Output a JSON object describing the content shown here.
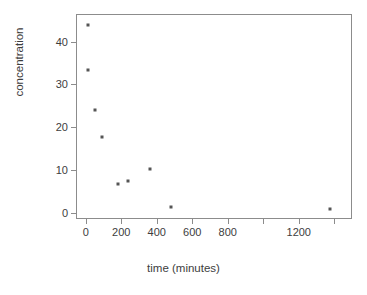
{
  "chart_data": {
    "type": "scatter",
    "title": "",
    "xlabel": "time (minutes)",
    "ylabel": "concentration",
    "xlim": [
      -55,
      1500
    ],
    "ylim": [
      -1.5,
      46.5
    ],
    "grid": false,
    "legend": null,
    "x": [
      10,
      10,
      50,
      90,
      180,
      240,
      360,
      480,
      1375
    ],
    "y": [
      44.0,
      33.5,
      24.0,
      17.8,
      6.8,
      7.4,
      10.2,
      1.3,
      0.8
    ],
    "points": [
      {
        "x": 10,
        "y": 44.0
      },
      {
        "x": 10,
        "y": 33.5
      },
      {
        "x": 50,
        "y": 24.0
      },
      {
        "x": 90,
        "y": 17.8
      },
      {
        "x": 180,
        "y": 6.8
      },
      {
        "x": 240,
        "y": 7.4
      },
      {
        "x": 360,
        "y": 10.2
      },
      {
        "x": 480,
        "y": 1.3
      },
      {
        "x": 1375,
        "y": 0.8
      }
    ],
    "xticks": [
      0,
      200,
      400,
      600,
      800,
      1000,
      1200,
      1400
    ],
    "xticklabels": [
      "0",
      "200",
      "400",
      "600",
      "800",
      "",
      "1200",
      ""
    ],
    "yticks": [
      0,
      10,
      20,
      30,
      40
    ],
    "yticklabels": [
      "0",
      "10",
      "20",
      "30",
      "40"
    ],
    "marker": "point",
    "marker_color": "#555555",
    "frame_color": "#8c8c8c",
    "background": "#ffffff"
  },
  "axes": {
    "x_title": "time (minutes)",
    "y_title": "concentration"
  }
}
